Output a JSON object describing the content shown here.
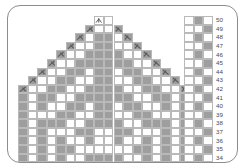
{
  "panel": {
    "name": "knitting-chart-panel",
    "border_color": "#8d8d8d",
    "background": "#ffffff",
    "corner_radius": "13px"
  },
  "colors": {
    "filled_stitch": "#9e9e9e",
    "empty_stitch": "#ffffff",
    "grid_line": "#b9b9b9",
    "symbol_stroke": "#5a5a5a",
    "row_number_text": "#4a4a4a"
  },
  "geometry": {
    "cell_width": 9.55,
    "cell_height": 8.6,
    "grid_left": 18,
    "grid_top": 16,
    "columns": 18,
    "rows": 17,
    "legend_left": 184,
    "legend_columns": 3,
    "rownum_left": 216
  },
  "chart_data": {
    "type": "heatmap",
    "title": "",
    "xlabel": "",
    "ylabel": "",
    "legend_position": "right",
    "grid": true,
    "row_labels": [
      "50",
      "49",
      "48",
      "47",
      "46",
      "45",
      "44",
      "43",
      "42",
      "41",
      "40",
      "39",
      "38",
      "37",
      "36",
      "35",
      "34"
    ],
    "row_label_top": 50,
    "row_label_bottom": 34,
    "value_key": {
      "0": "empty-stitch",
      "1": "filled-stitch",
      "-1": "no-stitch"
    },
    "matrix": [
      [
        -1,
        -1,
        -1,
        -1,
        -1,
        -1,
        -1,
        -1,
        0,
        0,
        -1,
        -1,
        -1,
        -1,
        -1,
        -1,
        -1,
        -1
      ],
      [
        -1,
        -1,
        -1,
        -1,
        -1,
        -1,
        -1,
        1,
        0,
        0,
        1,
        -1,
        -1,
        -1,
        -1,
        -1,
        -1,
        -1
      ],
      [
        -1,
        -1,
        -1,
        -1,
        -1,
        -1,
        1,
        0,
        1,
        1,
        0,
        1,
        -1,
        -1,
        -1,
        -1,
        -1,
        -1
      ],
      [
        -1,
        -1,
        -1,
        -1,
        -1,
        1,
        0,
        0,
        1,
        1,
        0,
        0,
        1,
        -1,
        -1,
        -1,
        -1,
        -1
      ],
      [
        -1,
        -1,
        -1,
        -1,
        1,
        0,
        0,
        1,
        1,
        1,
        1,
        0,
        0,
        1,
        -1,
        -1,
        -1,
        -1
      ],
      [
        -1,
        -1,
        -1,
        1,
        0,
        0,
        1,
        1,
        1,
        1,
        1,
        1,
        0,
        0,
        1,
        -1,
        -1,
        -1
      ],
      [
        -1,
        -1,
        1,
        0,
        0,
        1,
        1,
        0,
        1,
        1,
        0,
        1,
        1,
        0,
        0,
        1,
        -1,
        -1
      ],
      [
        -1,
        1,
        0,
        0,
        1,
        1,
        0,
        0,
        1,
        1,
        0,
        0,
        1,
        1,
        0,
        0,
        1,
        -1
      ],
      [
        1,
        0,
        0,
        1,
        1,
        0,
        0,
        1,
        1,
        1,
        1,
        0,
        0,
        1,
        1,
        0,
        0,
        1
      ],
      [
        1,
        0,
        1,
        1,
        0,
        0,
        1,
        1,
        1,
        1,
        1,
        1,
        0,
        0,
        1,
        1,
        0,
        1
      ],
      [
        1,
        0,
        1,
        0,
        0,
        1,
        1,
        0,
        1,
        1,
        0,
        1,
        1,
        0,
        0,
        1,
        0,
        1
      ],
      [
        1,
        0,
        0,
        0,
        1,
        1,
        0,
        0,
        1,
        1,
        0,
        0,
        1,
        1,
        0,
        0,
        0,
        1
      ],
      [
        1,
        0,
        1,
        1,
        1,
        0,
        0,
        1,
        1,
        1,
        1,
        0,
        0,
        1,
        1,
        1,
        0,
        1
      ],
      [
        1,
        0,
        1,
        0,
        0,
        0,
        1,
        1,
        0,
        0,
        1,
        1,
        0,
        0,
        0,
        1,
        0,
        1
      ],
      [
        1,
        0,
        1,
        0,
        1,
        0,
        0,
        1,
        0,
        0,
        1,
        0,
        0,
        1,
        0,
        1,
        0,
        1
      ],
      [
        1,
        0,
        1,
        0,
        1,
        1,
        0,
        0,
        0,
        0,
        0,
        0,
        1,
        1,
        0,
        1,
        0,
        1
      ],
      [
        1,
        0,
        1,
        0,
        1,
        0,
        0,
        1,
        1,
        1,
        1,
        0,
        0,
        1,
        0,
        1,
        0,
        1
      ]
    ],
    "symbols": [
      {
        "row": 0,
        "col": 8,
        "type": "central-double-decrease"
      },
      {
        "row": 1,
        "col": 7,
        "type": "left-leaning-decrease"
      },
      {
        "row": 1,
        "col": 10,
        "type": "right-leaning-decrease"
      },
      {
        "row": 2,
        "col": 6,
        "type": "left-leaning-decrease"
      },
      {
        "row": 2,
        "col": 11,
        "type": "right-leaning-decrease"
      },
      {
        "row": 3,
        "col": 5,
        "type": "left-leaning-decrease"
      },
      {
        "row": 3,
        "col": 12,
        "type": "right-leaning-decrease"
      },
      {
        "row": 4,
        "col": 4,
        "type": "left-leaning-decrease"
      },
      {
        "row": 4,
        "col": 13,
        "type": "right-leaning-decrease"
      },
      {
        "row": 5,
        "col": 3,
        "type": "left-leaning-decrease"
      },
      {
        "row": 5,
        "col": 14,
        "type": "right-leaning-decrease"
      },
      {
        "row": 6,
        "col": 2,
        "type": "left-leaning-decrease"
      },
      {
        "row": 6,
        "col": 15,
        "type": "right-leaning-decrease"
      },
      {
        "row": 7,
        "col": 1,
        "type": "left-leaning-decrease"
      },
      {
        "row": 7,
        "col": 16,
        "type": "right-leaning-decrease"
      },
      {
        "row": 8,
        "col": 0,
        "type": "left-leaning-decrease"
      },
      {
        "row": 8,
        "col": 17,
        "type": "right-leaning-decrease"
      }
    ],
    "legend_key": {
      "columns": 3,
      "rows": 17,
      "pattern_description": "alternating-checker-column",
      "cells": [
        [
          0,
          1,
          0
        ],
        [
          0,
          0,
          1
        ],
        [
          0,
          1,
          0
        ],
        [
          0,
          0,
          1
        ],
        [
          0,
          1,
          0
        ],
        [
          0,
          0,
          1
        ],
        [
          0,
          1,
          0
        ],
        [
          0,
          0,
          1
        ],
        [
          0,
          1,
          0
        ],
        [
          0,
          0,
          1
        ],
        [
          0,
          1,
          0
        ],
        [
          0,
          0,
          1
        ],
        [
          0,
          1,
          0
        ],
        [
          0,
          0,
          1
        ],
        [
          0,
          1,
          0
        ],
        [
          0,
          0,
          1
        ],
        [
          0,
          1,
          0
        ]
      ]
    }
  }
}
